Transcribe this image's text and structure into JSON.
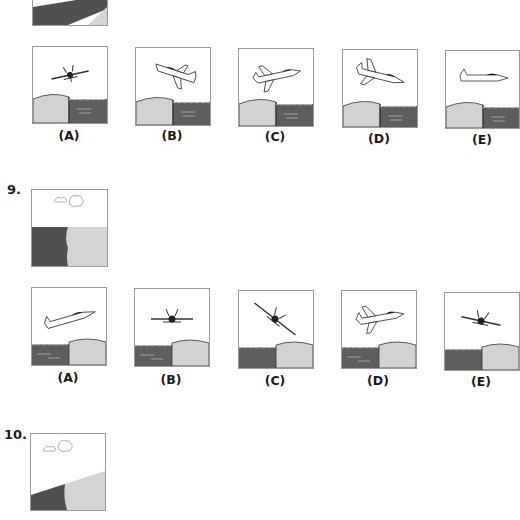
{
  "colors": {
    "land": "#d2d2d2",
    "water": "#5e5e5e",
    "dark_ground": "#505050",
    "frame": "#9a9a9a"
  },
  "q8": {
    "options": [
      {
        "label": "(A)",
        "view": "head-on, banked",
        "ground": "land-left/water-right"
      },
      {
        "label": "(B)",
        "view": "side, nose-left, climbing",
        "ground": "land-left/water-right"
      },
      {
        "label": "(C)",
        "view": "side, nose-right, climbing",
        "ground": "land-left/water-right"
      },
      {
        "label": "(D)",
        "view": "side, nose-right, diving",
        "ground": "land-left/water-right"
      },
      {
        "label": "(E)",
        "view": "side, nose-right, level",
        "ground": "land-left/water-right"
      }
    ]
  },
  "q9": {
    "number": "9.",
    "options": [
      {
        "label": "(A)",
        "view": "side, nose-right, climbing",
        "ground": "water-left/land-right"
      },
      {
        "label": "(B)",
        "view": "head-on, level",
        "ground": "water-left/land-right"
      },
      {
        "label": "(C)",
        "view": "head-on, steep bank",
        "ground": "water-left/land-right"
      },
      {
        "label": "(D)",
        "view": "side, nose-right, climbing",
        "ground": "water-left/land-right"
      },
      {
        "label": "(E)",
        "view": "head-on, slight bank",
        "ground": "water-left/land-right"
      }
    ]
  },
  "q10": {
    "number": "10."
  }
}
